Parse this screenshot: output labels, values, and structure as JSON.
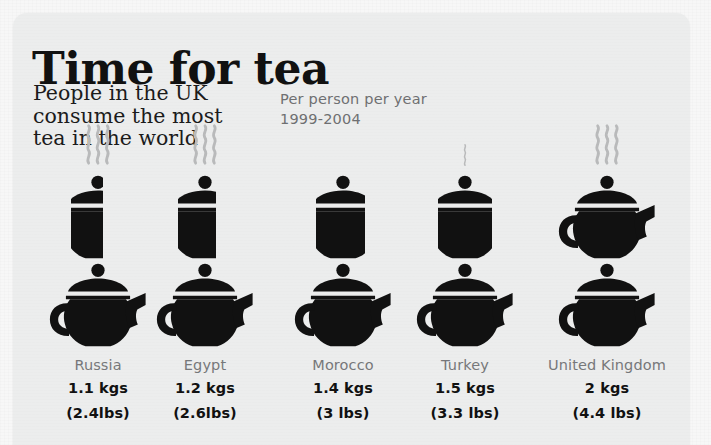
{
  "card": {
    "title": "Time for tea",
    "subtitle": "People in the UK\nconsume the most\ntea in the world",
    "note": "Per person per year\n1999-2004"
  },
  "colors": {
    "page_background": "#f7f7f7",
    "card_background": "#eceded",
    "icon": "#111111",
    "steam": "#b9babb",
    "country_label": "#77787a",
    "value_label": "#111111"
  },
  "chart_data": {
    "type": "bar",
    "title": "Time for tea",
    "subtitle": "People in the UK consume the most tea in the world",
    "annotation": "Per person per year 1999-2004",
    "unit": "kgs",
    "icon": "teapot-icon",
    "icon_unit_value": 1,
    "xlabel": "",
    "ylabel": "kgs per person per year",
    "ylim": [
      0,
      2
    ],
    "grid": false,
    "legend": false,
    "categories": [
      "Russia",
      "Egypt",
      "Morocco",
      "Turkey",
      "United Kingdom"
    ],
    "values": [
      1.1,
      1.2,
      1.4,
      1.5,
      2
    ],
    "values_lbs": [
      2.4,
      2.6,
      3,
      3.3,
      4.4
    ],
    "columns": [
      {
        "country": "Russia",
        "kgs": "1.1 kgs",
        "lbs": "(2.4lbs)",
        "value": 1.1,
        "full_pots": 1,
        "partial_fraction": 0.1,
        "steam": 3
      },
      {
        "country": "Egypt",
        "kgs": "1.2 kgs",
        "lbs": "(2.6lbs)",
        "value": 1.2,
        "full_pots": 1,
        "partial_fraction": 0.2,
        "steam": 3
      },
      {
        "country": "Morocco",
        "kgs": "1.4 kgs",
        "lbs": "(3 lbs)",
        "value": 1.4,
        "full_pots": 1,
        "partial_fraction": 0.4,
        "steam": 0
      },
      {
        "country": "Turkey",
        "kgs": "1.5 kgs",
        "lbs": "(3.3 lbs)",
        "value": 1.5,
        "full_pots": 1,
        "partial_fraction": 0.5,
        "steam": 1
      },
      {
        "country": "United Kingdom",
        "kgs": "2 kgs",
        "lbs": "(4.4 lbs)",
        "value": 2,
        "full_pots": 2,
        "partial_fraction": 0,
        "steam": 3
      }
    ]
  }
}
